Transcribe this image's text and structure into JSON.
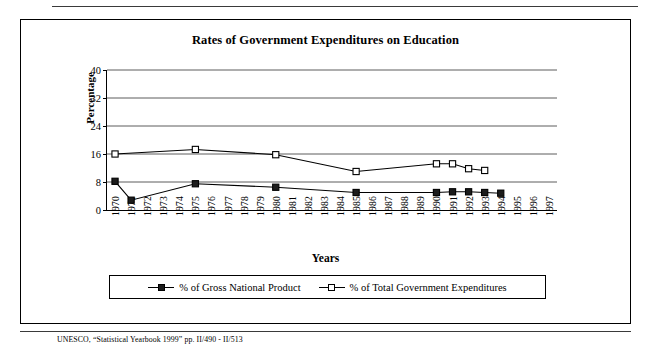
{
  "chart_data": {
    "type": "line",
    "title": "Rates of Government Expenditures on Education",
    "xlabel": "Years",
    "ylabel": "Percentage",
    "ylim": [
      0,
      40
    ],
    "yticks": [
      0,
      8,
      16,
      24,
      32,
      40
    ],
    "grid": true,
    "legend_position": "bottom",
    "categories": [
      "1970",
      "1971",
      "1972",
      "1973",
      "1974",
      "1975",
      "1976",
      "1977",
      "1978",
      "1979",
      "1980",
      "1981",
      "1982",
      "1983",
      "1984",
      "1985",
      "1986",
      "1987",
      "1988",
      "1989",
      "1990",
      "1991",
      "1992",
      "1993",
      "1994",
      "1995",
      "1996",
      "1997"
    ],
    "series": [
      {
        "name": "% of Gross National Product",
        "marker": "filled-square",
        "points": [
          {
            "x": "1970",
            "y": 8.2
          },
          {
            "x": "1971",
            "y": 2.8
          },
          {
            "x": "1975",
            "y": 7.5
          },
          {
            "x": "1980",
            "y": 6.5
          },
          {
            "x": "1985",
            "y": 5.0
          },
          {
            "x": "1990",
            "y": 5.0
          },
          {
            "x": "1991",
            "y": 5.2
          },
          {
            "x": "1992",
            "y": 5.2
          },
          {
            "x": "1993",
            "y": 5.0
          },
          {
            "x": "1994",
            "y": 4.8
          }
        ]
      },
      {
        "name": "% of Total Government Expenditures",
        "marker": "open-square",
        "points": [
          {
            "x": "1970",
            "y": 16.0
          },
          {
            "x": "1975",
            "y": 17.3
          },
          {
            "x": "1980",
            "y": 15.8
          },
          {
            "x": "1985",
            "y": 11.0
          },
          {
            "x": "1990",
            "y": 13.2
          },
          {
            "x": "1991",
            "y": 13.2
          },
          {
            "x": "1992",
            "y": 11.8
          },
          {
            "x": "1993",
            "y": 11.3
          }
        ]
      }
    ]
  },
  "legend": {
    "entries": [
      {
        "label": "% of Gross National Product",
        "marker": "filled-square"
      },
      {
        "label": "% of Total Government Expenditures",
        "marker": "open-square"
      }
    ]
  },
  "source": {
    "note": "UNESCO, “Statistical Yearbook 1999” pp. II/490 - II/513"
  },
  "colors": {
    "line": "#000000",
    "grid": "#4a4a4a",
    "frame": "#000000",
    "marker_fill": "#1c1c1c",
    "background": "#ffffff"
  }
}
